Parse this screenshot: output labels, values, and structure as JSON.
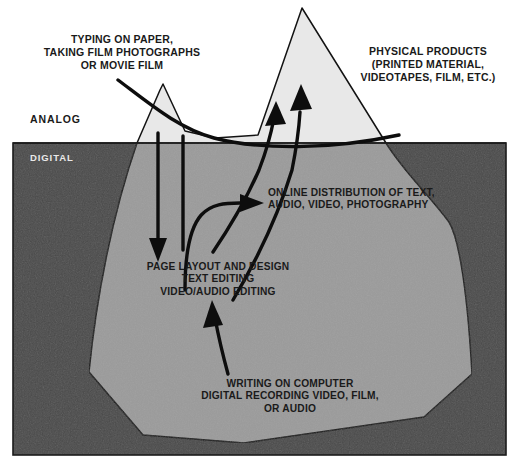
{
  "figure": {
    "type": "iceberg-diagram",
    "zones": {
      "above_water": {
        "label": "ANALOG"
      },
      "below_water": {
        "label": "DIGITAL"
      }
    },
    "labels": {
      "top_left": "TYPING ON PAPER,\nTAKING FILM PHOTOGRAPHS\nOR MOVIE FILM",
      "top_right": "PHYSICAL PRODUCTS\n(PRINTED MATERIAL,\nVIDEOTAPES, FILM, ETC.)",
      "online": "ONLINE DISTRIBUTION OF TEXT,\nAUDIO, VIDEO, PHOTOGRAPHY",
      "page_layout": "PAGE LAYOUT AND DESIGN\nTEXT EDITING\nVIDEO/AUDIO EDITING",
      "writing": "WRITING ON COMPUTER\nDIGITAL RECORDING VIDEO, FILM,\nOR AUDIO"
    },
    "colors": {
      "water": "#4a4a4a",
      "sky": "#ffffff",
      "iceberg_above": "#e8e8e8",
      "iceberg_below": "#9b9b9b",
      "stroke": "#111111",
      "text_dark": "#1a1a1a",
      "text_light": "#e9e9e9"
    },
    "arrows": [
      {
        "name": "typing-to-peak",
        "from": "TYPING ON PAPER, TAKING FILM PHOTOGRAPHS OR MOVIE FILM",
        "to": "iceberg waterline",
        "direction": "down-right"
      },
      {
        "name": "typing-to-page-layout",
        "from": "analog input",
        "to": "PAGE LAYOUT AND DESIGN",
        "direction": "down"
      },
      {
        "name": "page-layout-to-physical",
        "from": "PAGE LAYOUT AND DESIGN",
        "to": "PHYSICAL PRODUCTS",
        "direction": "up"
      },
      {
        "name": "page-layout-to-physical-2",
        "from": "editing",
        "to": "PHYSICAL PRODUCTS",
        "direction": "up"
      },
      {
        "name": "page-layout-to-online",
        "from": "PAGE LAYOUT AND DESIGN",
        "to": "ONLINE DISTRIBUTION OF TEXT, AUDIO, VIDEO, PHOTOGRAPHY",
        "direction": "right"
      },
      {
        "name": "writing-to-page-layout",
        "from": "WRITING ON COMPUTER",
        "to": "PAGE LAYOUT AND DESIGN",
        "direction": "up"
      }
    ]
  }
}
